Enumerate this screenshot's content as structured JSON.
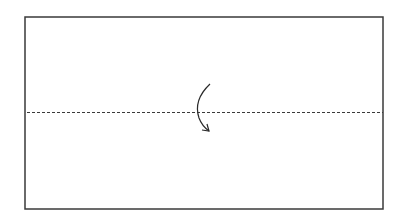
{
  "diagram": {
    "type": "fold-instruction",
    "paper": {
      "x": 25,
      "y": 17,
      "width": 358,
      "height": 192,
      "stroke": "#3a3a3a"
    },
    "fold_line": {
      "style": "valley-dashed",
      "y": 112,
      "x1": 27,
      "x2": 383,
      "stroke": "#3a3a3a"
    },
    "arrow": {
      "icon": "fold-down-arrow",
      "direction": "top-to-bottom",
      "stroke": "#2a2a2a"
    }
  }
}
